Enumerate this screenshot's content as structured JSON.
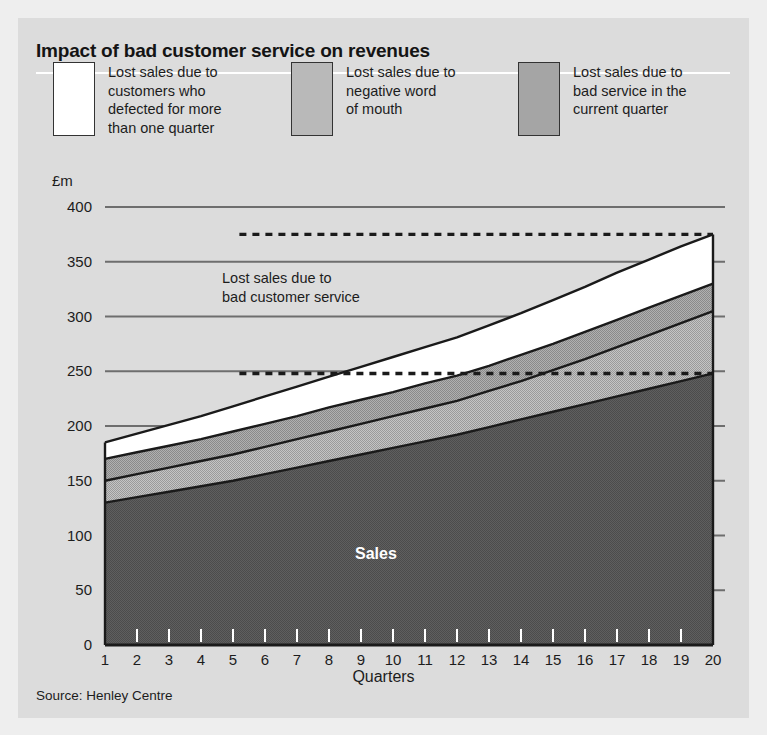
{
  "header": {
    "title": "Impact of bad customer service on revenues"
  },
  "legend": {
    "items": [
      {
        "label": "Lost sales due to\ncustomers who\ndefected for more\nthan one quarter",
        "swatch": "white",
        "color": "#ffffff"
      },
      {
        "label": "Lost sales due to\nnegative word\nof mouth",
        "swatch": "mid-gray",
        "color": "#b9b9b9"
      },
      {
        "label": "Lost sales due to\nbad service in the\ncurrent quarter",
        "swatch": "dark-gray",
        "color": "#a5a5a5"
      }
    ]
  },
  "annotations": {
    "band_note": "Lost sales due to\nbad customer service",
    "sales_label": "Sales"
  },
  "source": "Source: Henley Centre",
  "colors": {
    "page_background": "#eeeeee",
    "panel_background": "#dcdcdc",
    "sales_fill": "#5a5a5a",
    "word_of_mouth_fill": "#b9b9b9",
    "current_quarter_fill": "#a5a5a5",
    "defected_fill": "#ffffff",
    "gridline": "#6e6e6e",
    "outline": "#1a1a1a",
    "text": "#1c1c1c"
  },
  "chart_data": {
    "type": "area",
    "title": "Impact of bad customer service on revenues",
    "xlabel": "Quarters",
    "ylabel": "£m",
    "ylim": [
      0,
      400
    ],
    "xlim": [
      1,
      20
    ],
    "yticks": [
      0,
      50,
      100,
      150,
      200,
      250,
      300,
      350,
      400
    ],
    "ytick_labels": [
      "0",
      "50",
      "100",
      "150",
      "200",
      "250",
      "300",
      "350",
      "400"
    ],
    "xticks": [
      1,
      2,
      3,
      4,
      5,
      6,
      7,
      8,
      9,
      10,
      11,
      12,
      13,
      14,
      15,
      16,
      17,
      18,
      19,
      20
    ],
    "xtick_labels": [
      "1",
      "2",
      "3",
      "4",
      "5",
      "6",
      "7",
      "8",
      "9",
      "10",
      "11",
      "12",
      "13",
      "14",
      "15",
      "16",
      "17",
      "18",
      "19",
      "20"
    ],
    "grid": true,
    "stacked": true,
    "legend_position": "top",
    "x": [
      1,
      2,
      3,
      4,
      5,
      6,
      7,
      8,
      9,
      10,
      11,
      12,
      13,
      14,
      15,
      16,
      17,
      18,
      19,
      20
    ],
    "series": [
      {
        "name": "Sales",
        "fill": "#5a5a5a",
        "values": [
          130,
          135,
          140,
          145,
          150,
          156,
          162,
          168,
          174,
          180,
          186,
          192,
          199,
          206,
          213,
          220,
          227,
          234,
          241,
          248
        ],
        "cumulative": [
          130,
          135,
          140,
          145,
          150,
          156,
          162,
          168,
          174,
          180,
          186,
          192,
          199,
          206,
          213,
          220,
          227,
          234,
          241,
          248
        ]
      },
      {
        "name": "Lost sales due to negative word of mouth",
        "fill": "#b9b9b9",
        "values": [
          20,
          21,
          22,
          23,
          24,
          25,
          26,
          27,
          28,
          29,
          30,
          31,
          33,
          35,
          38,
          41,
          45,
          49,
          53,
          57
        ],
        "cumulative": [
          150,
          156,
          162,
          168,
          174,
          181,
          188,
          195,
          202,
          209,
          216,
          223,
          232,
          241,
          251,
          261,
          272,
          283,
          294,
          305
        ]
      },
      {
        "name": "Lost sales due to bad service in the current quarter",
        "fill": "#a5a5a5",
        "values": [
          20,
          20,
          20,
          20,
          21,
          21,
          21,
          22,
          22,
          22,
          23,
          23,
          23,
          24,
          24,
          25,
          25,
          25,
          25,
          25
        ],
        "cumulative": [
          170,
          176,
          182,
          188,
          195,
          202,
          209,
          217,
          224,
          231,
          239,
          246,
          255,
          265,
          275,
          286,
          297,
          308,
          319,
          330
        ]
      },
      {
        "name": "Lost sales due to customers who defected for more than one quarter",
        "fill": "#ffffff",
        "values": [
          15,
          17,
          19,
          21,
          23,
          25,
          27,
          28,
          30,
          32,
          33,
          35,
          37,
          38,
          40,
          41,
          43,
          44,
          45,
          45
        ],
        "cumulative": [
          185,
          193,
          201,
          209,
          218,
          227,
          236,
          245,
          254,
          263,
          272,
          281,
          292,
          303,
          315,
          327,
          340,
          352,
          364,
          375
        ]
      }
    ],
    "reference_lines": [
      {
        "name": "total-with-lost-sales",
        "value": 375,
        "style": "dashed",
        "x_from": 5.2,
        "x_to": 20
      },
      {
        "name": "actual-sales",
        "value": 248,
        "style": "dashed",
        "x_from": 5.2,
        "x_to": 20
      }
    ]
  }
}
